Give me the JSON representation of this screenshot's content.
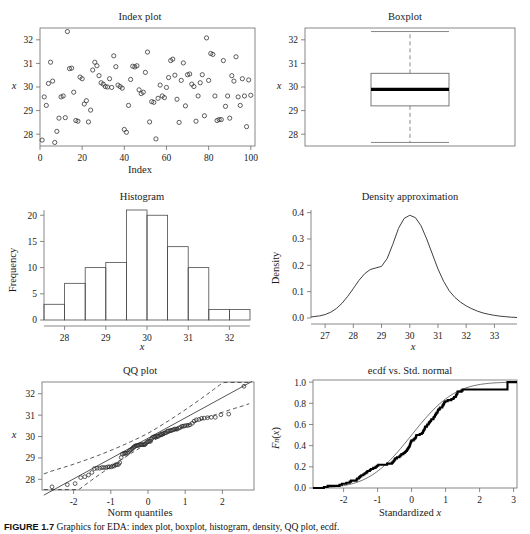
{
  "figure": {
    "caption_label": "FIGURE 1.7",
    "caption_text": "Graphics for EDA: index plot, boxplot, histogram, density, QQ plot, ecdf."
  },
  "chart_data": [
    {
      "type": "scatter",
      "panel": "index-plot",
      "title": "Index plot",
      "xlabel": "Index",
      "ylabel": "x",
      "xlim": [
        0,
        102
      ],
      "ylim": [
        27.5,
        32.5
      ],
      "xticks": [
        0,
        20,
        40,
        60,
        80,
        100
      ],
      "yticks": [
        28,
        29,
        30,
        31,
        32
      ],
      "grid": false,
      "marker": "open-circle",
      "x": [
        1,
        2,
        3,
        4,
        5,
        6,
        7,
        8,
        9,
        10,
        11,
        12,
        13,
        14,
        15,
        16,
        17,
        18,
        19,
        20,
        21,
        22,
        23,
        24,
        25,
        26,
        27,
        28,
        29,
        30,
        31,
        32,
        33,
        34,
        35,
        36,
        37,
        38,
        39,
        40,
        41,
        42,
        43,
        44,
        45,
        46,
        47,
        48,
        49,
        50,
        51,
        52,
        53,
        54,
        55,
        56,
        57,
        58,
        59,
        60,
        61,
        62,
        63,
        64,
        65,
        66,
        67,
        68,
        69,
        70,
        71,
        72,
        73,
        74,
        75,
        76,
        77,
        78,
        79,
        80,
        81,
        82,
        83,
        84,
        85,
        86,
        87,
        88,
        89,
        90,
        91,
        92,
        93,
        94,
        95,
        96,
        97,
        98,
        99,
        100
      ],
      "y": [
        27.75,
        29.58,
        29.22,
        30.15,
        31.05,
        30.25,
        27.65,
        28.12,
        28.68,
        29.58,
        29.62,
        28.7,
        32.35,
        30.78,
        30.8,
        29.78,
        28.58,
        28.55,
        30.42,
        30.35,
        29.28,
        29.42,
        28.52,
        29.02,
        30.72,
        31.05,
        30.9,
        30.48,
        30.18,
        30.12,
        30.02,
        30.0,
        30.35,
        29.98,
        31.32,
        30.86,
        30.08,
        30.02,
        29.95,
        28.2,
        28.08,
        29.22,
        30.32,
        30.88,
        30.85,
        30.9,
        29.88,
        29.72,
        29.78,
        30.62,
        31.48,
        28.52,
        29.38,
        29.35,
        27.8,
        29.52,
        30.08,
        29.62,
        29.55,
        29.98,
        30.4,
        31.12,
        31.18,
        30.5,
        29.48,
        28.5,
        30.28,
        31.02,
        29.2,
        30.52,
        30.55,
        30.12,
        30.02,
        28.55,
        29.62,
        30.18,
        30.52,
        28.78,
        32.08,
        30.28,
        31.42,
        31.38,
        29.62,
        28.58,
        28.62,
        28.62,
        31.12,
        29.18,
        29.62,
        28.68,
        30.48,
        30.25,
        31.28,
        29.58,
        29.22,
        30.35,
        29.62,
        28.32,
        30.3,
        29.65
      ]
    },
    {
      "type": "boxplot",
      "panel": "boxplot",
      "title": "Boxplot",
      "ylabel": "x",
      "ylim": [
        27.5,
        32.5
      ],
      "yticks": [
        28,
        29,
        30,
        31,
        32
      ],
      "grid": false,
      "min_whisker": 27.65,
      "q1": 29.2,
      "median": 29.9,
      "q3": 30.58,
      "max_whisker": 32.35,
      "outliers": []
    },
    {
      "type": "bar",
      "panel": "histogram",
      "title": "Histogram",
      "xlabel": "x",
      "ylabel": "Frequency",
      "xlim": [
        27.5,
        32.5
      ],
      "ylim": [
        0,
        21
      ],
      "xticks": [
        28,
        29,
        30,
        31,
        32
      ],
      "yticks": [
        0,
        5,
        10,
        15,
        20
      ],
      "grid": false,
      "bin_width": 0.5,
      "bin_edges": [
        27.5,
        28.0,
        28.5,
        29.0,
        29.5,
        30.0,
        30.5,
        31.0,
        31.5,
        32.0,
        32.5
      ],
      "categories": [
        "27.5-28.0",
        "28.0-28.5",
        "28.5-29.0",
        "29.0-29.5",
        "29.5-30.0",
        "30.0-30.5",
        "30.5-31.0",
        "31.0-31.5",
        "31.5-32.0",
        "32.0-32.5"
      ],
      "values": [
        3,
        7,
        10,
        11,
        21,
        20,
        14,
        10,
        2,
        2
      ]
    },
    {
      "type": "line",
      "panel": "density-approximation",
      "title": "Density approximation",
      "xlabel": "x",
      "ylabel": "Density",
      "xlim": [
        26.5,
        33.8
      ],
      "ylim": [
        0,
        0.41
      ],
      "xticks": [
        27,
        28,
        29,
        30,
        31,
        32,
        33
      ],
      "yticks": [
        0.0,
        0.1,
        0.2,
        0.3,
        0.4
      ],
      "ytick_labels": [
        "0.0",
        "0.1",
        "0.2",
        "0.3",
        "0.4"
      ],
      "grid": false,
      "peak_x": 30.0,
      "peak_y": 0.39,
      "x": [
        26.5,
        26.8,
        27.0,
        27.2,
        27.4,
        27.6,
        27.8,
        28.0,
        28.2,
        28.4,
        28.6,
        28.8,
        29.0,
        29.2,
        29.4,
        29.6,
        29.8,
        30.0,
        30.2,
        30.4,
        30.6,
        30.8,
        31.0,
        31.2,
        31.4,
        31.6,
        31.8,
        32.0,
        32.2,
        32.4,
        32.6,
        32.8,
        33.0,
        33.2,
        33.4,
        33.6,
        33.8
      ],
      "y": [
        0.004,
        0.008,
        0.013,
        0.022,
        0.036,
        0.056,
        0.082,
        0.112,
        0.143,
        0.168,
        0.184,
        0.19,
        0.196,
        0.226,
        0.28,
        0.34,
        0.378,
        0.39,
        0.381,
        0.35,
        0.3,
        0.243,
        0.186,
        0.139,
        0.103,
        0.078,
        0.06,
        0.046,
        0.035,
        0.026,
        0.019,
        0.014,
        0.01,
        0.007,
        0.005,
        0.003,
        0.002
      ]
    },
    {
      "type": "scatter",
      "panel": "qq-plot",
      "title": "QQ plot",
      "xlabel": "Norm quantiles",
      "ylabel": "x",
      "xlim": [
        -2.85,
        2.85
      ],
      "ylim": [
        27.5,
        32.55
      ],
      "xticks": [
        -2,
        -1,
        0,
        1,
        2
      ],
      "yticks": [
        28,
        29,
        30,
        31,
        32
      ],
      "grid": false,
      "reference_line": {
        "intercept": 29.92,
        "slope": 0.95
      },
      "confidence_bands": "dashed",
      "marker": "open-circle",
      "theoretical": [
        -2.58,
        -2.17,
        -1.96,
        -1.81,
        -1.7,
        -1.6,
        -1.51,
        -1.44,
        -1.37,
        -1.3,
        -1.24,
        -1.19,
        -1.13,
        -1.08,
        -1.04,
        -0.99,
        -0.95,
        -0.91,
        -0.87,
        -0.83,
        -0.79,
        -0.76,
        -0.72,
        -0.69,
        -0.65,
        -0.62,
        -0.59,
        -0.55,
        -0.52,
        -0.49,
        -0.46,
        -0.43,
        -0.4,
        -0.37,
        -0.35,
        -0.32,
        -0.29,
        -0.26,
        -0.23,
        -0.2,
        -0.18,
        -0.15,
        -0.12,
        -0.09,
        -0.07,
        -0.04,
        -0.01,
        0.01,
        0.04,
        0.07,
        0.09,
        0.12,
        0.15,
        0.18,
        0.2,
        0.23,
        0.26,
        0.29,
        0.32,
        0.35,
        0.37,
        0.4,
        0.43,
        0.46,
        0.49,
        0.52,
        0.55,
        0.59,
        0.62,
        0.65,
        0.69,
        0.72,
        0.76,
        0.79,
        0.83,
        0.87,
        0.91,
        0.95,
        0.99,
        1.04,
        1.08,
        1.13,
        1.19,
        1.24,
        1.3,
        1.37,
        1.44,
        1.51,
        1.6,
        1.7,
        1.81,
        1.96,
        2.17,
        2.58
      ],
      "sample": [
        27.65,
        27.75,
        27.8,
        28.08,
        28.12,
        28.2,
        28.32,
        28.5,
        28.52,
        28.52,
        28.55,
        28.55,
        28.55,
        28.58,
        28.58,
        28.58,
        28.62,
        28.62,
        28.68,
        28.68,
        28.7,
        28.78,
        29.02,
        29.18,
        29.2,
        29.22,
        29.22,
        29.22,
        29.28,
        29.35,
        29.38,
        29.42,
        29.48,
        29.52,
        29.55,
        29.58,
        29.58,
        29.58,
        29.62,
        29.62,
        29.62,
        29.62,
        29.62,
        29.62,
        29.65,
        29.72,
        29.75,
        29.78,
        29.78,
        29.78,
        29.88,
        29.95,
        29.98,
        29.98,
        30.0,
        30.02,
        30.02,
        30.02,
        30.08,
        30.08,
        30.12,
        30.12,
        30.15,
        30.18,
        30.18,
        30.25,
        30.25,
        30.28,
        30.28,
        30.3,
        30.32,
        30.35,
        30.35,
        30.35,
        30.4,
        30.42,
        30.48,
        30.48,
        30.5,
        30.52,
        30.52,
        30.55,
        30.62,
        30.72,
        30.78,
        30.8,
        30.85,
        30.86,
        30.88,
        30.9,
        30.9,
        31.02,
        31.05,
        32.35
      ]
    },
    {
      "type": "line",
      "panel": "ecdf-vs-std-normal",
      "title": "ecdf vs. Std. normal",
      "xlabel": "Standardized x",
      "ylabel": "Fn(x)",
      "xlim": [
        -2.9,
        3.1
      ],
      "ylim": [
        0,
        1.02
      ],
      "xticks": [
        -2,
        -1,
        0,
        1,
        2,
        3
      ],
      "yticks": [
        0.0,
        0.2,
        0.4,
        0.6,
        0.8,
        1.0
      ],
      "ytick_labels": [
        "0.0",
        "0.2",
        "0.4",
        "0.6",
        "0.8",
        "1.0"
      ],
      "grid": false,
      "series": [
        {
          "name": "ecdf",
          "style": "thick-step"
        },
        {
          "name": "Std. normal CDF",
          "style": "thin-smooth"
        }
      ],
      "standardized": [
        -2.58,
        -2.47,
        -2.12,
        -2.05,
        -1.92,
        -1.82,
        -1.78,
        -1.62,
        -1.6,
        -1.55,
        -1.52,
        -1.48,
        -1.42,
        -1.38,
        -1.33,
        -1.3,
        -1.23,
        -1.2,
        -1.13,
        -1.06,
        -1.02,
        -0.98,
        -0.72,
        -0.58,
        -0.55,
        -0.52,
        -0.5,
        -0.48,
        -0.43,
        -0.36,
        -0.33,
        -0.3,
        -0.24,
        -0.2,
        -0.17,
        -0.14,
        -0.12,
        -0.1,
        -0.08,
        -0.06,
        -0.05,
        -0.04,
        -0.03,
        -0.02,
        0.0,
        0.06,
        0.09,
        0.12,
        0.13,
        0.14,
        0.24,
        0.3,
        0.33,
        0.34,
        0.36,
        0.38,
        0.39,
        0.4,
        0.45,
        0.46,
        0.5,
        0.51,
        0.54,
        0.57,
        0.58,
        0.64,
        0.65,
        0.68,
        0.69,
        0.71,
        0.73,
        0.76,
        0.77,
        0.78,
        0.82,
        0.84,
        0.9,
        0.91,
        0.93,
        0.95,
        0.96,
        0.99,
        1.06,
        1.17,
        1.23,
        1.25,
        1.3,
        1.31,
        1.33,
        1.35,
        1.35,
        1.47,
        1.5,
        2.82
      ],
      "ecdf_values": [
        0.01,
        0.02,
        0.03,
        0.04,
        0.05,
        0.06,
        0.07,
        0.08,
        0.09,
        0.1,
        0.11,
        0.12,
        0.13,
        0.14,
        0.15,
        0.16,
        0.17,
        0.18,
        0.19,
        0.2,
        0.21,
        0.22,
        0.23,
        0.24,
        0.25,
        0.26,
        0.27,
        0.28,
        0.29,
        0.3,
        0.31,
        0.32,
        0.33,
        0.34,
        0.35,
        0.36,
        0.37,
        0.38,
        0.39,
        0.4,
        0.41,
        0.42,
        0.43,
        0.44,
        0.45,
        0.46,
        0.47,
        0.48,
        0.49,
        0.5,
        0.51,
        0.52,
        0.53,
        0.54,
        0.55,
        0.56,
        0.57,
        0.58,
        0.59,
        0.6,
        0.61,
        0.62,
        0.63,
        0.64,
        0.65,
        0.66,
        0.67,
        0.68,
        0.69,
        0.7,
        0.71,
        0.72,
        0.73,
        0.74,
        0.75,
        0.76,
        0.77,
        0.78,
        0.79,
        0.8,
        0.81,
        0.82,
        0.83,
        0.84,
        0.85,
        0.86,
        0.87,
        0.88,
        0.89,
        0.9,
        0.91,
        0.92,
        0.93,
        1.0
      ]
    }
  ]
}
